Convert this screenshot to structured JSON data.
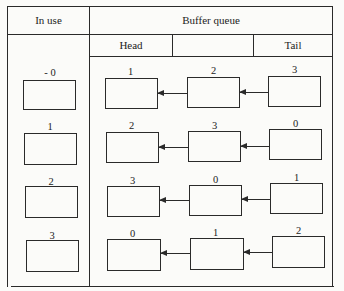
{
  "table": {
    "in_use_header": "In use",
    "buffer_queue_header": "Buffer queue",
    "head_label": "Head",
    "middle_label": "",
    "tail_label": "Tail"
  },
  "in_use": [
    {
      "label": "- 0"
    },
    {
      "label": "1"
    },
    {
      "label": "2"
    },
    {
      "label": "3"
    }
  ],
  "queues": [
    {
      "head": "1",
      "middle": "2",
      "tail": "3"
    },
    {
      "head": "2",
      "middle": "3",
      "tail": "0"
    },
    {
      "head": "3",
      "middle": "0",
      "tail": "1"
    },
    {
      "head": "0",
      "middle": "1",
      "tail": "2"
    }
  ]
}
